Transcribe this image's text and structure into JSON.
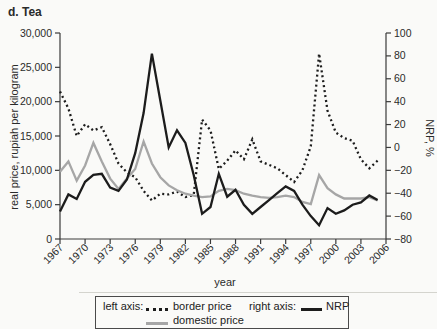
{
  "title": "d. Tea",
  "colors": {
    "ink": "#1c1c1c",
    "series_gray": "#a6a6a6",
    "axis": "#3a3a3a",
    "tick_text": "#2a2a2a",
    "background": "#fafaf8"
  },
  "axes": {
    "left_label": "real price, rupiah per kilogram",
    "right_label": "NRP, %",
    "x_label": "year"
  },
  "legend": {
    "left_axis_caption": "left axis:",
    "right_axis_caption": "right axis:",
    "border_price_label": "border price",
    "domestic_price_label": "domestic price",
    "nrp_label": "NRP"
  },
  "chart_data": {
    "type": "line",
    "title": "d. Tea",
    "xlabel": "year",
    "left_axis": {
      "label": "real price, rupiah per kilogram",
      "min": 0,
      "max": 30000
    },
    "right_axis": {
      "label": "NRP, %",
      "min": -80,
      "max": 100
    },
    "x_range_years": [
      1967,
      2006
    ],
    "grid": false,
    "legend_position": "bottom",
    "left_ticks": [
      {
        "v": 0,
        "label": "0"
      },
      {
        "v": 5000,
        "label": "5,000"
      },
      {
        "v": 10000,
        "label": "10,000"
      },
      {
        "v": 15000,
        "label": "15,000"
      },
      {
        "v": 20000,
        "label": "20,000"
      },
      {
        "v": 25000,
        "label": "25,000"
      },
      {
        "v": 30000,
        "label": "30,000"
      }
    ],
    "right_ticks": [
      {
        "v": -80,
        "label": "−80"
      },
      {
        "v": -60,
        "label": "−60"
      },
      {
        "v": -40,
        "label": "−40"
      },
      {
        "v": -20,
        "label": "−20"
      },
      {
        "v": 0,
        "label": "0"
      },
      {
        "v": 20,
        "label": "20"
      },
      {
        "v": 40,
        "label": "40"
      },
      {
        "v": 60,
        "label": "60"
      },
      {
        "v": 80,
        "label": "80"
      },
      {
        "v": 100,
        "label": "100"
      }
    ],
    "x_ticks": [
      {
        "v": 1967,
        "label": "1967"
      },
      {
        "v": 1970,
        "label": "1970"
      },
      {
        "v": 1973,
        "label": "1973"
      },
      {
        "v": 1976,
        "label": "1976"
      },
      {
        "v": 1979,
        "label": "1979"
      },
      {
        "v": 1982,
        "label": "1982"
      },
      {
        "v": 1985,
        "label": "1985"
      },
      {
        "v": 1988,
        "label": "1988"
      },
      {
        "v": 1991,
        "label": "1991"
      },
      {
        "v": 1994,
        "label": "1994"
      },
      {
        "v": 1997,
        "label": "1997"
      },
      {
        "v": 2000,
        "label": "2000"
      },
      {
        "v": 2003,
        "label": "2003"
      },
      {
        "v": 2006,
        "label": "2006"
      }
    ],
    "x": [
      1967,
      1968,
      1969,
      1970,
      1971,
      1972,
      1973,
      1974,
      1975,
      1976,
      1977,
      1978,
      1979,
      1980,
      1981,
      1982,
      1983,
      1984,
      1985,
      1986,
      1987,
      1988,
      1989,
      1990,
      1991,
      1992,
      1993,
      1994,
      1995,
      1996,
      1997,
      1998,
      1999,
      2000,
      2001,
      2002,
      2003,
      2004,
      2005
    ],
    "series": [
      {
        "name": "border price",
        "axis": "left",
        "style": "dotted",
        "color": "#1c1c1c",
        "values": [
          21500,
          19000,
          15000,
          16700,
          15800,
          16300,
          13800,
          11000,
          9700,
          9000,
          7000,
          5600,
          6600,
          6500,
          6900,
          6100,
          6400,
          17400,
          15800,
          10200,
          11400,
          12900,
          11600,
          14500,
          11300,
          10800,
          10300,
          9300,
          8300,
          10000,
          13500,
          27000,
          18700,
          15500,
          14700,
          14300,
          11600,
          10300,
          11400
        ]
      },
      {
        "name": "domestic price",
        "axis": "left",
        "style": "solid",
        "color": "#a6a6a6",
        "values": [
          9800,
          11300,
          8500,
          10700,
          14000,
          11300,
          8800,
          7300,
          8800,
          10200,
          14200,
          11000,
          9000,
          7800,
          7100,
          6600,
          6300,
          6100,
          6200,
          7000,
          7300,
          7100,
          6600,
          6300,
          6100,
          6000,
          6100,
          6300,
          6100,
          5400,
          5100,
          9300,
          7400,
          6500,
          5900,
          5900,
          5900,
          6100,
          5600
        ]
      },
      {
        "name": "NRP",
        "axis": "right",
        "style": "solid",
        "color": "#1c1c1c",
        "values": [
          -56,
          -41,
          -45,
          -30,
          -24,
          -23,
          -35,
          -38,
          -28,
          -5,
          30,
          82,
          41,
          0,
          15,
          4,
          -24,
          -58,
          -52,
          -23,
          -43,
          -37,
          -50,
          -58,
          -52,
          -46,
          -40,
          -34,
          -38,
          -50,
          -60,
          -68,
          -53,
          -58,
          -55,
          -50,
          -48,
          -42,
          -46
        ]
      }
    ]
  }
}
